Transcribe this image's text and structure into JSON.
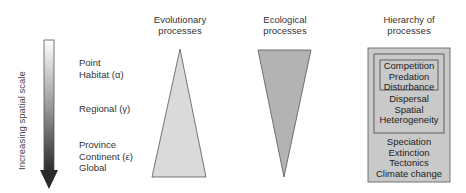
{
  "axis": {
    "label": "Increasing spatial scale",
    "direction": "down"
  },
  "scale_levels": [
    {
      "lines": [
        "Point",
        "Habitat (α)"
      ]
    },
    {
      "lines": [
        "Regional (γ)"
      ]
    },
    {
      "lines": [
        "Province",
        "Continent (ε)",
        "Global"
      ]
    }
  ],
  "columns": {
    "evolutionary": {
      "title_lines": [
        "Evolutionary",
        "processes"
      ],
      "shape": "triangle-up",
      "fill": "#d9d9d9"
    },
    "ecological": {
      "title_lines": [
        "Ecological",
        "processes"
      ],
      "shape": "triangle-down",
      "fill": "#b3b3b3"
    },
    "hierarchy": {
      "title_lines": [
        "Hierarchy of",
        "processes"
      ],
      "fill": "#c8c8c8",
      "inner": [
        "Competition",
        "Predation",
        "Disturbance"
      ],
      "middle": [
        "Dispersal",
        "Spatial",
        "Heterogeneity"
      ],
      "outer": [
        "Speciation",
        "Extinction",
        "Tectonics",
        "Climate change"
      ]
    }
  }
}
